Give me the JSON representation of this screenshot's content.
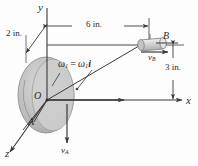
{
  "figure": {
    "colors": {
      "line": "#3a3a3a",
      "disk_outer": "#b9b9b9",
      "disk_inner": "#cfcfcf",
      "disk_edge": "#8f8f8f",
      "collar_body": "#d2d2d2",
      "collar_edge": "#7d7d7d",
      "text": "#2b2b2b",
      "background": "#fdfdfd"
    },
    "axes": [
      {
        "name": "y-axis",
        "label": "y"
      },
      {
        "name": "x-axis",
        "label": "x"
      },
      {
        "name": "z-axis",
        "label": "z"
      }
    ],
    "points": [
      {
        "name": "origin",
        "label": "O"
      },
      {
        "name": "point-a",
        "label": "A"
      },
      {
        "name": "point-b",
        "label": "B"
      }
    ],
    "dimensions": [
      {
        "name": "dim-2in",
        "label": "2 in."
      },
      {
        "name": "dim-6in",
        "label": "6 in."
      },
      {
        "name": "dim-3in",
        "label": "3 in."
      }
    ],
    "vectors": [
      {
        "name": "velocity-a",
        "base": "v",
        "sub": "A"
      },
      {
        "name": "velocity-b",
        "base": "v",
        "sub": "B"
      }
    ],
    "annotations": {
      "omega": {
        "base": "ω",
        "sub1": "1",
        "equals": "=",
        "magnitude": "ω",
        "sub2": "1",
        "unit_vector": "i"
      }
    }
  }
}
